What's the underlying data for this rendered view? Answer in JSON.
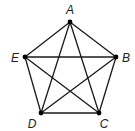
{
  "diagram": {
    "type": "complete-graph",
    "name": "K5",
    "colors": {
      "edge": "#1a1a1a",
      "vertex": "#000000",
      "label": "#222222",
      "background": "#ffffff"
    },
    "vertices": [
      {
        "id": "A",
        "label": "A",
        "x": 70,
        "y": 22,
        "lx": 70,
        "ly": 14
      },
      {
        "id": "B",
        "label": "B",
        "x": 116,
        "y": 57,
        "lx": 126,
        "ly": 62
      },
      {
        "id": "C",
        "label": "C",
        "x": 99,
        "y": 113,
        "lx": 104,
        "ly": 128
      },
      {
        "id": "D",
        "label": "D",
        "x": 41,
        "y": 113,
        "lx": 32,
        "ly": 128
      },
      {
        "id": "E",
        "label": "E",
        "x": 25,
        "y": 57,
        "lx": 15,
        "ly": 62
      }
    ],
    "edges": [
      [
        "A",
        "B"
      ],
      [
        "A",
        "C"
      ],
      [
        "A",
        "D"
      ],
      [
        "A",
        "E"
      ],
      [
        "B",
        "C"
      ],
      [
        "B",
        "D"
      ],
      [
        "B",
        "E"
      ],
      [
        "C",
        "D"
      ],
      [
        "C",
        "E"
      ],
      [
        "D",
        "E"
      ]
    ]
  }
}
